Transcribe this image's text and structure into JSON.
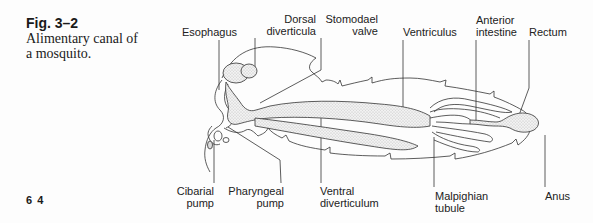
{
  "figure": {
    "number": "Fig. 3–2",
    "caption": "Alimentary canal of a mosquito."
  },
  "page_number": "6 4",
  "labels_top": [
    {
      "id": "esophagus",
      "lines": [
        "Esophagus"
      ]
    },
    {
      "id": "dorsal-diverticula",
      "lines": [
        "Dorsal",
        "diverticula"
      ]
    },
    {
      "id": "stomodael-valve",
      "lines": [
        "Stomodael",
        "valve"
      ]
    },
    {
      "id": "ventriculus",
      "lines": [
        "Ventriculus"
      ]
    },
    {
      "id": "anterior-intestine",
      "lines": [
        "Anterior",
        "intestine"
      ]
    },
    {
      "id": "rectum",
      "lines": [
        "Rectum"
      ]
    }
  ],
  "labels_bottom": [
    {
      "id": "cibarial-pump",
      "lines": [
        "Cibarial",
        "pump"
      ]
    },
    {
      "id": "pharyngeal-pump",
      "lines": [
        "Pharyngeal",
        "pump"
      ]
    },
    {
      "id": "ventral-diverticulum",
      "lines": [
        "Ventral",
        "diverticulum"
      ]
    },
    {
      "id": "malpighian-tubule",
      "lines": [
        "Malpighian",
        "tubule"
      ]
    },
    {
      "id": "anus",
      "lines": [
        "Anus"
      ]
    }
  ]
}
